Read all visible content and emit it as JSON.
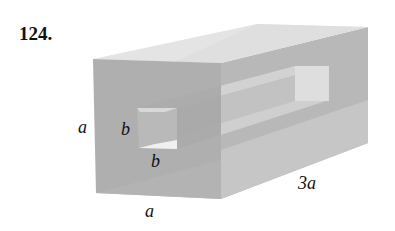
{
  "problem": {
    "number": "124."
  },
  "figure": {
    "labels": {
      "height": "a",
      "width": "a",
      "length": "3a",
      "hole_height": "b",
      "hole_width": "b"
    },
    "colors": {
      "front_face": "#a9a9a9",
      "top_face": "#e6e6e6",
      "side_face": "#bdbdbd",
      "back_face": "#b2b2b2",
      "hole_top": "#cfcfcf",
      "hole_bottom": "#f2f2f2",
      "hole_inner": "#c4c4c4",
      "back_opening": "#dedede"
    }
  }
}
